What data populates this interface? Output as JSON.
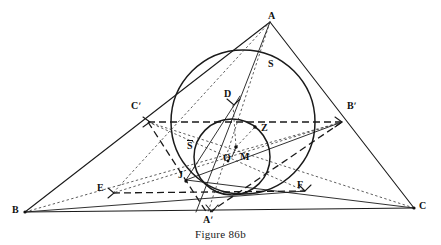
{
  "figure": {
    "caption": "Figure 86b",
    "width": 441,
    "height": 245,
    "background": "#ffffff",
    "stroke_color": "#1a1a1a"
  },
  "labels": {
    "A": {
      "text": "A",
      "x": 270,
      "y": 14
    },
    "B": {
      "text": "B",
      "x": 14,
      "y": 207
    },
    "C": {
      "text": "C",
      "x": 419,
      "y": 203
    },
    "Aprime": {
      "text": "Aʹ",
      "x": 203,
      "y": 216
    },
    "Bprime": {
      "text": "Bʹ",
      "x": 347,
      "y": 103
    },
    "Cprime": {
      "text": "Cʹ",
      "x": 132,
      "y": 103
    },
    "D": {
      "text": "D",
      "x": 224,
      "y": 92
    },
    "E": {
      "text": "E",
      "x": 98,
      "y": 185
    },
    "F": {
      "text": "F",
      "x": 297,
      "y": 182
    },
    "J": {
      "text": "J",
      "x": 178,
      "y": 172
    },
    "M": {
      "text": "M",
      "x": 241,
      "y": 154
    },
    "O": {
      "text": "O",
      "x": 224,
      "y": 155
    },
    "Z": {
      "text": "Z",
      "x": 262,
      "y": 125
    },
    "S": {
      "text": "S",
      "x": 269,
      "y": 62
    },
    "Sbar": {
      "text": "S",
      "x": 188,
      "y": 143,
      "has_overbar": true
    }
  },
  "geometry": {
    "vertices": {
      "A": {
        "x": 270,
        "y": 22
      },
      "B": {
        "x": 25,
        "y": 212
      },
      "C": {
        "x": 414,
        "y": 208
      }
    },
    "midpoints": {
      "Aprime": {
        "x": 212,
        "y": 210
      },
      "Bprime": {
        "x": 342,
        "y": 122
      },
      "Cprime": {
        "x": 148,
        "y": 122
      }
    },
    "points": {
      "D": {
        "x": 233,
        "y": 105
      },
      "E": {
        "x": 113,
        "y": 193
      },
      "F": {
        "x": 305,
        "y": 191
      },
      "J": {
        "x": 186,
        "y": 180
      },
      "M": {
        "x": 236,
        "y": 147
      },
      "O": {
        "x": 232,
        "y": 155
      },
      "Z": {
        "x": 255,
        "y": 127
      }
    },
    "circles": {
      "large": {
        "cx": 243,
        "cy": 122,
        "r": 72,
        "label": "S"
      },
      "small": {
        "cx": 232,
        "cy": 157,
        "r": 38,
        "label": "S̄"
      }
    }
  },
  "dots": [
    {
      "name": "dot-M",
      "x": 236,
      "y": 147
    },
    {
      "name": "dot-O",
      "x": 228,
      "y": 161
    },
    {
      "name": "dot-Z",
      "x": 255,
      "y": 127
    },
    {
      "name": "dot-J",
      "x": 186,
      "y": 181
    },
    {
      "name": "dot-B",
      "x": 25,
      "y": 212
    },
    {
      "name": "dot-C",
      "x": 414,
      "y": 208
    }
  ]
}
